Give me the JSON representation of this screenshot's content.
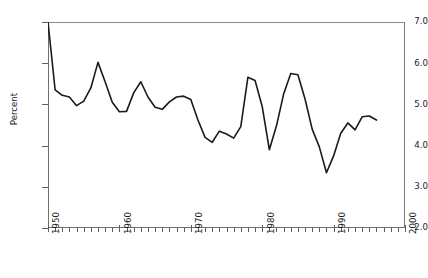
{
  "chart_data": {
    "type": "line",
    "title": "",
    "xlabel": "",
    "ylabel": "Percent",
    "xlim": [
      1950,
      2000
    ],
    "ylim": [
      2.0,
      7.0
    ],
    "grid": false,
    "legend": null,
    "y_ticks": [
      "7.0",
      "6.0",
      "5.0",
      "4.0",
      "3.0",
      "2.0"
    ],
    "y_tick_values": [
      7.0,
      6.0,
      5.0,
      4.0,
      3.0,
      2.0
    ],
    "x_ticks": [
      "1950",
      "1960",
      "1970",
      "1980",
      "1990",
      "2000"
    ],
    "x_tick_values": [
      1950,
      1960,
      1970,
      1980,
      1990,
      2000
    ],
    "x_minor_tick_interval": 1,
    "line_color": "#1a1a1a",
    "line_width": 1.6,
    "x": [
      1950,
      1951,
      1952,
      1953,
      1954,
      1955,
      1956,
      1957,
      1958,
      1959,
      1960,
      1961,
      1962,
      1963,
      1964,
      1965,
      1966,
      1967,
      1968,
      1969,
      1970,
      1971,
      1972,
      1973,
      1974,
      1975,
      1976,
      1977,
      1978,
      1979,
      1980,
      1981,
      1982,
      1983,
      1984,
      1985,
      1986,
      1987,
      1988,
      1989,
      1990,
      1991,
      1992,
      1993,
      1994,
      1995,
      1996
    ],
    "values": [
      7.0,
      5.35,
      5.22,
      5.18,
      4.97,
      5.08,
      5.4,
      6.02,
      5.55,
      5.05,
      4.82,
      4.83,
      5.28,
      5.55,
      5.18,
      4.93,
      4.88,
      5.06,
      5.18,
      5.2,
      5.12,
      4.62,
      4.2,
      4.08,
      4.35,
      4.28,
      4.18,
      4.46,
      5.66,
      5.58,
      4.95,
      3.9,
      4.48,
      5.25,
      5.75,
      5.72,
      5.13,
      4.4,
      3.97,
      3.34,
      3.75,
      4.3,
      4.55,
      4.38,
      4.7,
      4.72,
      4.62
    ]
  }
}
